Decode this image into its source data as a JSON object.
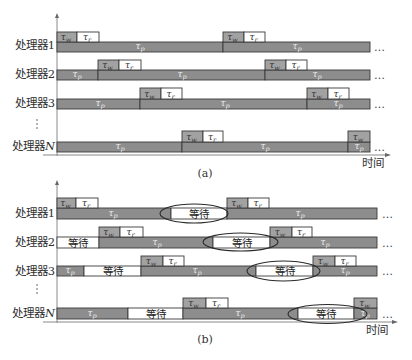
{
  "figure": {
    "width": 412,
    "height": 360,
    "colors": {
      "compute_fill": "#8d8d8d",
      "write_fill": "#a2a2a2",
      "read_fill": "#ffffff",
      "wait_fill": "#ffffff",
      "stroke": "#3a3a3a",
      "axis": "#8a8a8a",
      "ellipse": "#2a2a2a"
    },
    "legend_symbols": {
      "write": {
        "sym": "τ",
        "sub": "w"
      },
      "read": {
        "sym": "τ",
        "sub": "r"
      },
      "compute": {
        "sym": "τ",
        "sub": "p"
      }
    },
    "wait_label": "等待",
    "trailing_dots": "…",
    "panels": [
      {
        "id": "a",
        "caption": "(a)",
        "caption_x": 205,
        "caption_y": 177,
        "time_label": "时间",
        "time_x": 373,
        "time_y": 167,
        "axis": {
          "x": 57,
          "top": 13,
          "bottom": 156,
          "h_y": 155,
          "h_from": 43,
          "h_to": 391
        },
        "vdots": {
          "x": 36,
          "y": 124
        },
        "rows": [
          {
            "name": "processor-1",
            "label": "处理器1",
            "label_y": 49,
            "box_y": 32,
            "bar_y": 42,
            "bar_h": 10,
            "dots_x": 374,
            "segments": [
              {
                "x0": 57,
                "x1": 223,
                "kind": "compute",
                "lx": 140
              },
              {
                "x0": 223,
                "x1": 370,
                "kind": "compute",
                "lx": 297
              }
            ],
            "boxes": [
              {
                "x0": 57,
                "x1": 77,
                "kind": "write"
              },
              {
                "x0": 77,
                "x1": 99,
                "kind": "read"
              },
              {
                "x0": 223,
                "x1": 244,
                "kind": "write"
              },
              {
                "x0": 244,
                "x1": 265,
                "kind": "read"
              }
            ],
            "ellipses": []
          },
          {
            "name": "processor-2",
            "label": "处理器2",
            "label_y": 78,
            "box_y": 60,
            "bar_y": 70,
            "bar_h": 10,
            "dots_x": 374,
            "segments": [
              {
                "x0": 57,
                "x1": 98,
                "kind": "compute",
                "lx": 77
              },
              {
                "x0": 98,
                "x1": 265,
                "kind": "compute",
                "lx": 182
              },
              {
                "x0": 265,
                "x1": 370,
                "kind": "compute",
                "lx": 317
              }
            ],
            "boxes": [
              {
                "x0": 98,
                "x1": 119,
                "kind": "write"
              },
              {
                "x0": 119,
                "x1": 141,
                "kind": "read"
              },
              {
                "x0": 265,
                "x1": 286,
                "kind": "write"
              },
              {
                "x0": 286,
                "x1": 307,
                "kind": "read"
              }
            ],
            "ellipses": []
          },
          {
            "name": "processor-3",
            "label": "处理器3",
            "label_y": 107,
            "box_y": 88,
            "bar_y": 99,
            "bar_h": 10,
            "dots_x": 374,
            "segments": [
              {
                "x0": 57,
                "x1": 140,
                "kind": "compute",
                "lx": 100
              },
              {
                "x0": 140,
                "x1": 307,
                "kind": "compute",
                "lx": 225
              },
              {
                "x0": 307,
                "x1": 370,
                "kind": "compute",
                "lx": 338
              }
            ],
            "boxes": [
              {
                "x0": 140,
                "x1": 161,
                "kind": "write"
              },
              {
                "x0": 161,
                "x1": 182,
                "kind": "read"
              },
              {
                "x0": 307,
                "x1": 328,
                "kind": "write"
              },
              {
                "x0": 328,
                "x1": 349,
                "kind": "read"
              }
            ],
            "ellipses": []
          },
          {
            "name": "processor-n",
            "label": "处理器",
            "label_italic": "N",
            "label_y": 150,
            "box_y": 131,
            "bar_y": 142,
            "bar_h": 10,
            "dots_x": 374,
            "segments": [
              {
                "x0": 57,
                "x1": 182,
                "kind": "compute",
                "lx": 120
              },
              {
                "x0": 182,
                "x1": 348,
                "kind": "compute",
                "lx": 265
              },
              {
                "x0": 348,
                "x1": 370,
                "kind": "compute",
                "lx": 359
              }
            ],
            "boxes": [
              {
                "x0": 182,
                "x1": 203,
                "kind": "write"
              },
              {
                "x0": 203,
                "x1": 223,
                "kind": "read"
              },
              {
                "x0": 348,
                "x1": 370,
                "kind": "write"
              }
            ],
            "ellipses": []
          }
        ]
      },
      {
        "id": "b",
        "caption": "(b)",
        "caption_x": 205,
        "caption_y": 343,
        "time_label": "时间",
        "time_x": 377,
        "time_y": 334,
        "axis": {
          "x": 57,
          "top": 180,
          "bottom": 323,
          "h_y": 322,
          "h_from": 43,
          "h_to": 398
        },
        "vdots": {
          "x": 36,
          "y": 289
        },
        "rows": [
          {
            "name": "processor-1",
            "label": "处理器1",
            "label_y": 217,
            "box_y": 198,
            "bar_y": 208,
            "bar_h": 11,
            "dots_x": 382,
            "segments": [
              {
                "x0": 57,
                "x1": 171,
                "kind": "compute",
                "lx": 113
              },
              {
                "x0": 171,
                "x1": 227,
                "kind": "wait"
              },
              {
                "x0": 227,
                "x1": 377,
                "kind": "compute",
                "lx": 300
              }
            ],
            "boxes": [
              {
                "x0": 57,
                "x1": 76,
                "kind": "write"
              },
              {
                "x0": 76,
                "x1": 98,
                "kind": "read"
              },
              {
                "x0": 227,
                "x1": 248,
                "kind": "write"
              },
              {
                "x0": 248,
                "x1": 269,
                "kind": "read"
              }
            ],
            "ellipses": [
              {
                "cx": 194,
                "cy": 213.5,
                "rx": 34,
                "ry": 9.5
              }
            ]
          },
          {
            "name": "processor-2",
            "label": "处理器2",
            "label_y": 246,
            "box_y": 227,
            "bar_y": 237,
            "bar_h": 11,
            "dots_x": 382,
            "segments": [
              {
                "x0": 57,
                "x1": 99,
                "kind": "wait"
              },
              {
                "x0": 99,
                "x1": 213,
                "kind": "compute",
                "lx": 157
              },
              {
                "x0": 213,
                "x1": 270,
                "kind": "wait"
              },
              {
                "x0": 270,
                "x1": 377,
                "kind": "compute",
                "lx": 325
              }
            ],
            "boxes": [
              {
                "x0": 99,
                "x1": 120,
                "kind": "write"
              },
              {
                "x0": 120,
                "x1": 143,
                "kind": "read"
              },
              {
                "x0": 270,
                "x1": 292,
                "kind": "write"
              },
              {
                "x0": 292,
                "x1": 312,
                "kind": "read"
              }
            ],
            "ellipses": [
              {
                "cx": 240.5,
                "cy": 242,
                "rx": 37.5,
                "ry": 9
              }
            ]
          },
          {
            "name": "processor-3",
            "label": "处理器3",
            "label_y": 275,
            "box_y": 256,
            "bar_y": 266,
            "bar_h": 10,
            "dots_x": 382,
            "segments": [
              {
                "x0": 57,
                "x1": 84,
                "kind": "compute",
                "lx": 70
              },
              {
                "x0": 84,
                "x1": 141,
                "kind": "wait"
              },
              {
                "x0": 141,
                "x1": 256,
                "kind": "compute",
                "lx": 197
              },
              {
                "x0": 256,
                "x1": 313,
                "kind": "wait"
              },
              {
                "x0": 313,
                "x1": 377,
                "kind": "compute",
                "lx": 345
              }
            ],
            "boxes": [
              {
                "x0": 141,
                "x1": 163,
                "kind": "write"
              },
              {
                "x0": 163,
                "x1": 184,
                "kind": "read"
              },
              {
                "x0": 313,
                "x1": 335,
                "kind": "write"
              },
              {
                "x0": 335,
                "x1": 356,
                "kind": "read"
              }
            ],
            "ellipses": [
              {
                "cx": 283.5,
                "cy": 271,
                "rx": 36.5,
                "ry": 10
              }
            ]
          },
          {
            "name": "processor-n",
            "label": "处理器",
            "label_italic": "N",
            "label_y": 317,
            "box_y": 298,
            "bar_y": 308,
            "bar_h": 11,
            "dots_x": 382,
            "segments": [
              {
                "x0": 57,
                "x1": 128,
                "kind": "compute",
                "lx": 92
              },
              {
                "x0": 128,
                "x1": 183,
                "kind": "wait"
              },
              {
                "x0": 183,
                "x1": 298,
                "kind": "compute",
                "lx": 240
              },
              {
                "x0": 298,
                "x1": 354,
                "kind": "wait"
              },
              {
                "x0": 354,
                "x1": 377,
                "kind": "compute",
                "lx": 365
              }
            ],
            "boxes": [
              {
                "x0": 183,
                "x1": 206,
                "kind": "write"
              },
              {
                "x0": 206,
                "x1": 228,
                "kind": "read"
              },
              {
                "x0": 354,
                "x1": 377,
                "kind": "write"
              }
            ],
            "ellipses": [
              {
                "cx": 327.5,
                "cy": 314,
                "rx": 39.5,
                "ry": 9.5
              }
            ]
          }
        ]
      }
    ]
  }
}
